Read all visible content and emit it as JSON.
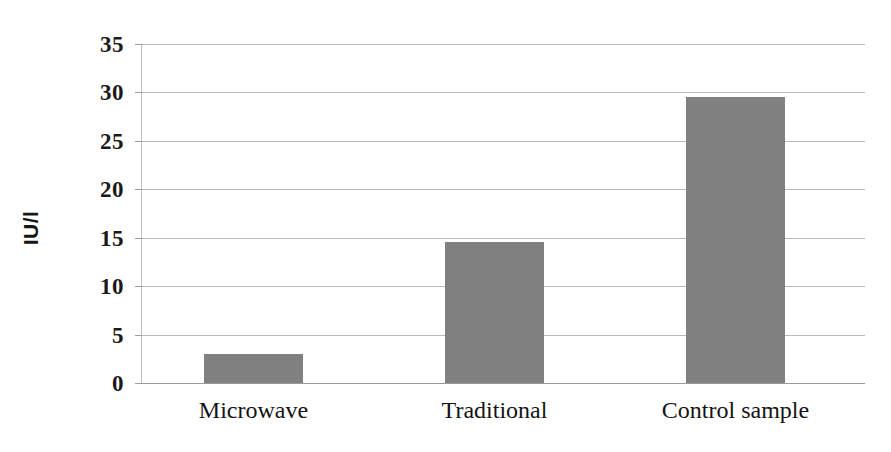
{
  "chart_data": {
    "type": "bar",
    "title": "",
    "subtitle": "",
    "xlabel": "",
    "ylabel": "IU/l",
    "categories": [
      "Microwave",
      "Traditional",
      "Control sample"
    ],
    "values": [
      3.0,
      14.6,
      29.5
    ],
    "series": [
      {
        "name": "",
        "values": [
          3.0,
          14.6,
          29.5
        ],
        "color": "#808080"
      }
    ],
    "ylim": [
      0,
      35
    ],
    "yticks": [
      0,
      5,
      10,
      15,
      20,
      25,
      30,
      35
    ],
    "ytick_labels": [
      "0",
      "5",
      "10",
      "15",
      "20",
      "25",
      "30",
      "35"
    ],
    "grid": true,
    "grid_axis": "y",
    "legend": false,
    "legend_position": "none",
    "bar_color": "#808080",
    "gridline_color": "#b9b9b9",
    "axis_color": "#9a9a9a",
    "background": "#ffffff",
    "annotations": []
  }
}
